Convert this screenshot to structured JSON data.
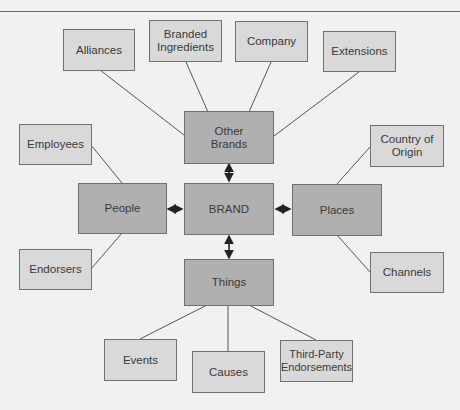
{
  "diagram": {
    "center": {
      "label": "BRAND"
    },
    "primary": {
      "other_brands": {
        "label": "Other Brands"
      },
      "people": {
        "label": "People"
      },
      "places": {
        "label": "Places"
      },
      "things": {
        "label": "Things"
      }
    },
    "secondary": {
      "alliances": {
        "label": "Alliances"
      },
      "branded_ingredients": {
        "label": "Branded Ingredients"
      },
      "company": {
        "label": "Company"
      },
      "extensions": {
        "label": "Extensions"
      },
      "employees": {
        "label": "Employees"
      },
      "endorsers": {
        "label": "Endorsers"
      },
      "country_of_origin": {
        "label": "Country of Origin"
      },
      "channels": {
        "label": "Channels"
      },
      "events": {
        "label": "Events"
      },
      "causes": {
        "label": "Causes"
      },
      "third_party_endorsements": {
        "label": "Third-Party Endorsements"
      }
    },
    "colors": {
      "background": "#f1f1ef",
      "primary_fill": "#b0b0b0",
      "secondary_fill": "#d9d9d9",
      "line": "#555555"
    }
  }
}
